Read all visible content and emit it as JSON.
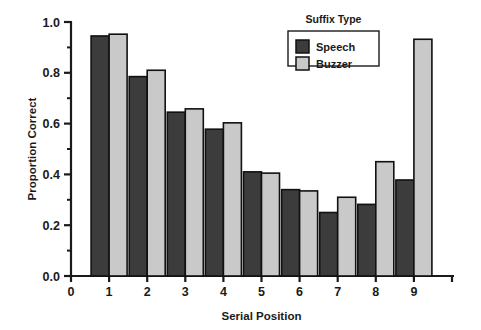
{
  "chart_data": {
    "type": "bar",
    "title": "",
    "xlabel": "Serial Position",
    "ylabel": "Proportion Correct",
    "categories": [
      "1",
      "2",
      "3",
      "4",
      "5",
      "6",
      "7",
      "8",
      "9"
    ],
    "series": [
      {
        "name": "Speech",
        "color": "#3c3c3c",
        "values": [
          0.945,
          0.785,
          0.645,
          0.578,
          0.41,
          0.34,
          0.25,
          0.282,
          0.378
        ]
      },
      {
        "name": "Buzzer",
        "color": "#c9c9c9",
        "values": [
          0.952,
          0.81,
          0.658,
          0.603,
          0.405,
          0.335,
          0.31,
          0.45,
          0.932
        ]
      }
    ],
    "ylim": [
      0.0,
      1.0
    ],
    "ytick_labels": [
      "0.0",
      "0.2",
      "0.4",
      "0.6",
      "0.8",
      "1.0"
    ],
    "ytick_values": [
      0.0,
      0.2,
      0.4,
      0.6,
      0.8,
      1.0
    ],
    "yminor_step": 0.1,
    "xtick_labels": [
      "0",
      "1",
      "2",
      "3",
      "4",
      "5",
      "6",
      "7",
      "8",
      "9"
    ],
    "xtick_values": [
      0,
      1,
      2,
      3,
      4,
      5,
      6,
      7,
      8,
      9
    ],
    "xlim": [
      0,
      10
    ],
    "grid": false,
    "legend": {
      "title": "Suffix Type",
      "position": "top-right",
      "entries": [
        {
          "label": "Speech",
          "color": "#3c3c3c"
        },
        {
          "label": "Buzzer",
          "color": "#c9c9c9"
        }
      ]
    },
    "axis_color": "#1a1a1a",
    "bar_edge_color": "#111111",
    "background": "#ffffff"
  }
}
